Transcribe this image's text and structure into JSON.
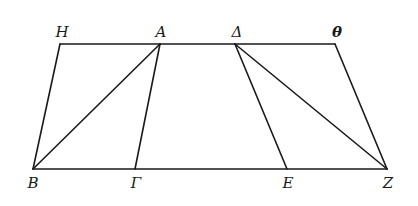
{
  "diagram": {
    "type": "geometry",
    "colors": {
      "stroke": "#1a1a1a",
      "background": "#ffffff"
    },
    "points": {
      "H": {
        "label": "H",
        "x": 60,
        "y": 44
      },
      "A": {
        "label": "A",
        "x": 160,
        "y": 44
      },
      "Delta": {
        "label": "Δ",
        "x": 235,
        "y": 44
      },
      "Theta": {
        "label": "θ",
        "x": 335,
        "y": 44
      },
      "B": {
        "label": "B",
        "x": 33,
        "y": 169
      },
      "Gamma": {
        "label": "Γ",
        "x": 135,
        "y": 169
      },
      "E": {
        "label": "E",
        "x": 287,
        "y": 169
      },
      "Z": {
        "label": "Z",
        "x": 387,
        "y": 169
      }
    },
    "segments": [
      [
        "H",
        "Theta"
      ],
      [
        "B",
        "Z"
      ],
      [
        "H",
        "B"
      ],
      [
        "A",
        "Gamma"
      ],
      [
        "A",
        "B"
      ],
      [
        "Delta",
        "E"
      ],
      [
        "Delta",
        "Z"
      ],
      [
        "Theta",
        "Z"
      ]
    ],
    "labels": {
      "H": "H",
      "A": "A",
      "Delta": "Δ",
      "Theta": "θ",
      "B": "B",
      "Gamma": "Γ",
      "E": "E",
      "Z": "Z"
    }
  }
}
